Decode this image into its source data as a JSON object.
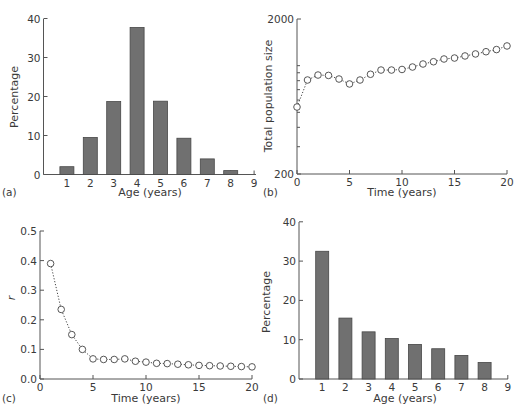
{
  "chart_data": [
    {
      "panel": "(a)",
      "type": "bar",
      "title": "",
      "xlabel": "Age (years)",
      "ylabel": "Percentage",
      "categories": [
        1,
        2,
        3,
        4,
        5,
        6,
        7,
        8
      ],
      "values": [
        2.0,
        9.5,
        18.7,
        37.7,
        18.8,
        9.3,
        4.0,
        1.0
      ],
      "xticks": [
        1,
        2,
        3,
        4,
        5,
        6,
        7,
        8,
        9
      ],
      "yticks": [
        0,
        10,
        20,
        30,
        40
      ],
      "xlim": [
        0,
        9
      ],
      "ylim": [
        0,
        40
      ],
      "grid": false,
      "box": {
        "x0": 43.5,
        "y0": 174.5,
        "xscale": 23.4,
        "yscale": 3.9,
        "ytop": 19,
        "xend": 256,
        "barw": 14
      }
    },
    {
      "panel": "(b)",
      "type": "line",
      "title": "",
      "xlabel": "Time (years)",
      "ylabel": "Total population size",
      "yscale_type": "log",
      "x": [
        0,
        1,
        2,
        3,
        4,
        5,
        6,
        7,
        8,
        9,
        10,
        11,
        12,
        13,
        14,
        15,
        16,
        17,
        18,
        19,
        20
      ],
      "values": [
        541,
        808,
        870,
        865,
        820,
        762,
        808,
        880,
        937,
        937,
        945,
        980,
        1025,
        1060,
        1104,
        1120,
        1155,
        1190,
        1230,
        1270,
        1340
      ],
      "xticks": [
        0,
        5,
        10,
        15,
        20
      ],
      "yticks": [
        200,
        2000
      ],
      "yminor_ticks": [
        300,
        400,
        500,
        600,
        700,
        800,
        900,
        1000
      ],
      "xlim": [
        0,
        20
      ],
      "ylim": [
        200,
        2000
      ],
      "grid": false,
      "markers": "open-circle",
      "linestyle": "dotted",
      "box": {
        "x0": 297,
        "y0": 174,
        "xscale": 10.5,
        "ytop": 19,
        "decade_px": 155,
        "xend": 507
      }
    },
    {
      "panel": "(c)",
      "type": "line",
      "title": "",
      "xlabel": "Time (years)",
      "ylabel": "r",
      "x": [
        1,
        2,
        3,
        4,
        5,
        6,
        7,
        8,
        9,
        10,
        11,
        12,
        13,
        14,
        15,
        16,
        17,
        18,
        19,
        20
      ],
      "values": [
        0.39,
        0.235,
        0.15,
        0.1,
        0.068,
        0.066,
        0.066,
        0.068,
        0.06,
        0.057,
        0.053,
        0.052,
        0.05,
        0.048,
        0.046,
        0.045,
        0.044,
        0.043,
        0.042,
        0.041
      ],
      "xticks": [
        0,
        5,
        10,
        15,
        20
      ],
      "yticks": [
        0.0,
        0.1,
        0.2,
        0.3,
        0.4,
        0.5
      ],
      "xlim": [
        0,
        20
      ],
      "ylim": [
        0.0,
        0.5
      ],
      "grid": false,
      "markers": "open-circle",
      "linestyle": "dotted",
      "box": {
        "x0": 40,
        "y0": 379,
        "xscale": 10.6,
        "yscale": 296,
        "ytop": 231,
        "xend": 252
      }
    },
    {
      "panel": "(d)",
      "type": "bar",
      "title": "",
      "xlabel": "Age (years)",
      "ylabel": "Percentage",
      "categories": [
        1,
        2,
        3,
        4,
        5,
        6,
        7,
        8
      ],
      "values": [
        32.5,
        15.5,
        12.0,
        10.3,
        8.8,
        7.7,
        6.0,
        4.2
      ],
      "xticks": [
        1,
        2,
        3,
        4,
        5,
        6,
        7,
        8,
        9
      ],
      "yticks": [
        0,
        10,
        20,
        30,
        40
      ],
      "xlim": [
        0,
        9
      ],
      "ylim": [
        0,
        40
      ],
      "grid": false,
      "box": {
        "x0": 299,
        "y0": 379,
        "xscale": 23.2,
        "yscale": 3.93,
        "ytop": 222,
        "xend": 508,
        "barw": 13
      }
    }
  ],
  "panels": {
    "a": {
      "label": "(a)",
      "xlabel": "Age (years)",
      "ylabel": "Percentage"
    },
    "b": {
      "label": "(b)",
      "xlabel": "Time (years)",
      "ylabel": "Total population size"
    },
    "c": {
      "label": "(c)",
      "xlabel": "Time (years)",
      "ylabel": "r"
    },
    "d": {
      "label": "(d)",
      "xlabel": "Age (years)",
      "ylabel": "Percentage"
    }
  }
}
